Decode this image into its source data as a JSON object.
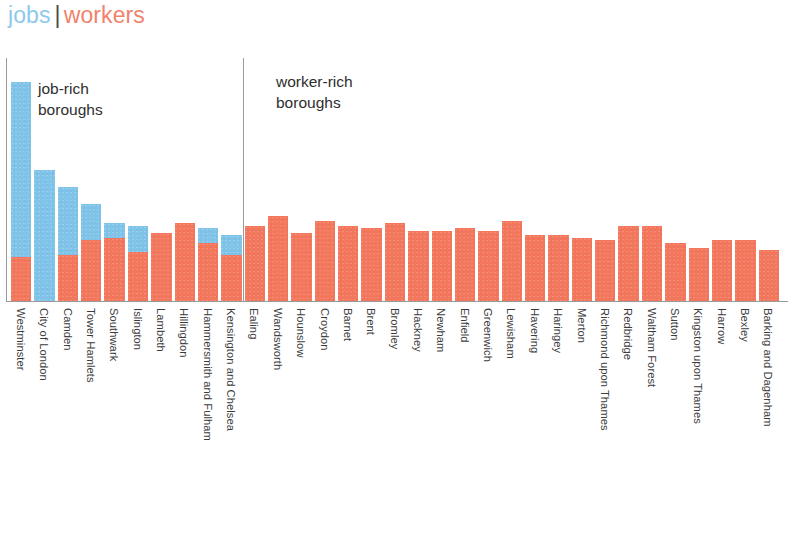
{
  "title": {
    "jobs_label": "jobs",
    "separator": "|",
    "workers_label": "workers",
    "jobs_color": "#8ec9ea",
    "workers_color": "#f0836c"
  },
  "annotations": {
    "job_rich": "job-rich\nboroughs",
    "worker_rich": "worker-rich\nboroughs"
  },
  "colors": {
    "jobs": "#7fc3e8",
    "workers": "#f2775d",
    "axis": "#9a9a9a",
    "background": "#ffffff"
  },
  "chart_data": {
    "type": "bar",
    "subtype": "stacked-column",
    "xlabel": "",
    "ylabel": "",
    "grid": false,
    "legend": [
      "jobs",
      "workers"
    ],
    "legend_position": "top-left",
    "ylim": [
      0,
      100
    ],
    "divider_after_category": "Kensington and Chelsea",
    "annotations": [
      {
        "text": "job-rich boroughs",
        "region": "left"
      },
      {
        "text": "worker-rich boroughs",
        "region": "right"
      }
    ],
    "categories": [
      "Westminster",
      "City of London",
      "Camden",
      "Tower Hamlets",
      "Southwark",
      "Islington",
      "Lambeth",
      "Hillingdon",
      "Hammersmith and Fulham",
      "Kensington and Chelsea",
      "Ealing",
      "Wandsworth",
      "Hounslow",
      "Croydon",
      "Barnet",
      "Brent",
      "Bromley",
      "Hackney",
      "Newham",
      "Enfield",
      "Greenwich",
      "Lewisham",
      "Havering",
      "Haringey",
      "Merton",
      "Richmond upon Thames",
      "Redbridge",
      "Waltham Forest",
      "Sutton",
      "Kingston upon Thames",
      "Harrow",
      "Bexley",
      "Barking and Dagenham"
    ],
    "series": [
      {
        "name": "workers",
        "color": "#f2775d",
        "values": [
          18,
          0,
          19,
          25,
          26,
          20,
          28,
          32,
          24,
          19,
          31,
          35,
          28,
          33,
          31,
          30,
          32,
          29,
          29,
          30,
          29,
          33,
          27,
          27,
          26,
          25,
          31,
          31,
          24,
          22,
          25,
          25,
          21
        ]
      },
      {
        "name": "jobs",
        "color": "#7fc3e8",
        "values": [
          72,
          54,
          28,
          15,
          6,
          11,
          0,
          0,
          6,
          8,
          0,
          0,
          0,
          0,
          0,
          0,
          0,
          0,
          0,
          0,
          0,
          0,
          0,
          0,
          0,
          0,
          0,
          0,
          0,
          0,
          0,
          0,
          0
        ]
      }
    ],
    "totals": [
      90,
      54,
      47,
      40,
      32,
      31,
      28,
      32,
      30,
      27,
      31,
      35,
      28,
      33,
      31,
      30,
      32,
      29,
      29,
      30,
      29,
      33,
      27,
      27,
      26,
      25,
      31,
      31,
      24,
      22,
      25,
      25,
      21
    ]
  }
}
